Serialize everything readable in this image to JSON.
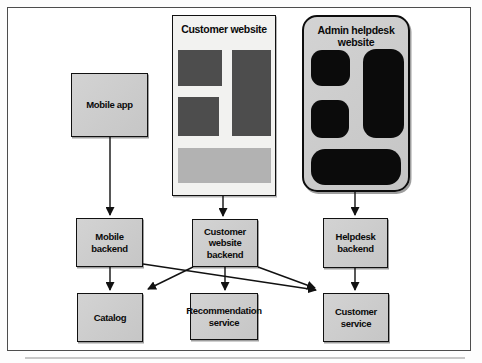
{
  "figure": {
    "background": "#ffffff",
    "frame_border_color": "#4d4d4d"
  },
  "diagram": {
    "panels": {
      "customer_website": {
        "title": "Customer website"
      },
      "admin_helpdesk": {
        "title": "Admin helpdesk website"
      }
    },
    "nodes": {
      "mobile_app": {
        "label": "Mobile app"
      },
      "mobile_backend": {
        "label": "Mobile backend"
      },
      "customer_website_backend": {
        "label": "Customer website backend"
      },
      "helpdesk_backend": {
        "label": "Helpdesk backend"
      },
      "catalog": {
        "label": "Catalog"
      },
      "recommendation_service": {
        "label": "Recommendation service"
      },
      "customer_service": {
        "label": "Customer service"
      }
    },
    "edges": [
      {
        "from": "mobile-app",
        "to": "mobile-backend",
        "x1": 110,
        "y1": 137,
        "x2": 110,
        "y2": 215
      },
      {
        "from": "customer-website",
        "to": "customer-website-backend",
        "x1": 223,
        "y1": 196,
        "x2": 223,
        "y2": 216
      },
      {
        "from": "admin-helpdesk-website",
        "to": "helpdesk-backend",
        "x1": 355,
        "y1": 192,
        "x2": 355,
        "y2": 215
      },
      {
        "from": "mobile-backend",
        "to": "catalog",
        "x1": 110,
        "y1": 267,
        "x2": 110,
        "y2": 290
      },
      {
        "from": "customer-website-backend",
        "to": "recommendation-service",
        "x1": 225,
        "y1": 267,
        "x2": 225,
        "y2": 290
      },
      {
        "from": "helpdesk-backend",
        "to": "customer-service",
        "x1": 355,
        "y1": 268,
        "x2": 355,
        "y2": 290
      },
      {
        "from": "mobile-backend",
        "to": "customer-service",
        "x1": 143,
        "y1": 264,
        "x2": 316,
        "y2": 290
      },
      {
        "from": "customer-website-backend",
        "to": "catalog",
        "x1": 193,
        "y1": 267,
        "x2": 148,
        "y2": 289
      },
      {
        "from": "customer-website-backend",
        "to": "customer-service",
        "x1": 258,
        "y1": 267,
        "x2": 315,
        "y2": 288
      }
    ],
    "colors": {
      "node_fill": "#c9c9c9",
      "node_border": "#111111",
      "customer_panel_bg": "#f2f2f0",
      "admin_panel_bg": "#c9c9c9",
      "wireframe_dark_block": "#4d4d4d",
      "wireframe_light_block": "#b2b2b2",
      "admin_black_block": "#0b0b0b",
      "arrow": "#111111"
    }
  }
}
